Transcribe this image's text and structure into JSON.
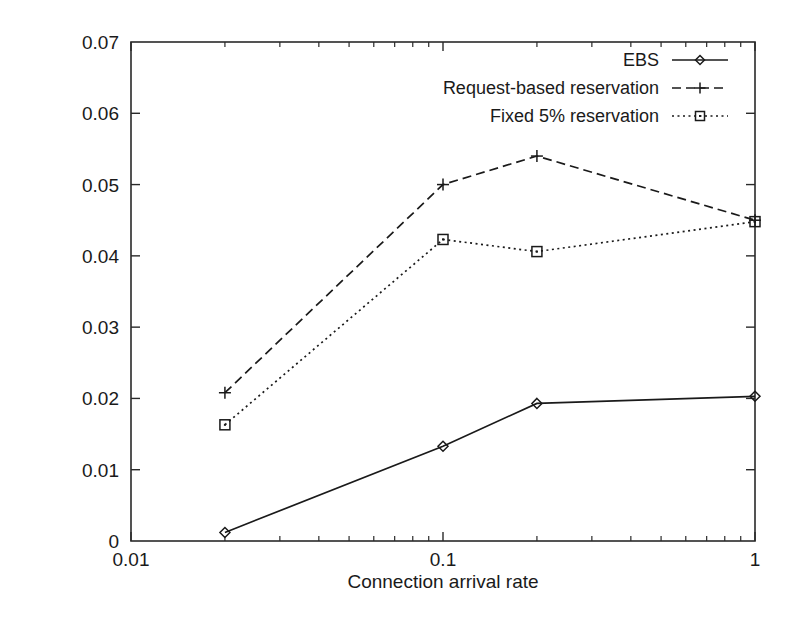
{
  "chart_data": {
    "type": "line",
    "title": "",
    "xlabel": "Connection arrival rate",
    "ylabel": "",
    "xscale": "log",
    "yscale": "linear",
    "xlim": [
      0.01,
      1
    ],
    "ylim": [
      0,
      0.07
    ],
    "grid": false,
    "legend_position": "top-right inside",
    "xticks": [
      "0.01",
      "0.1",
      "1"
    ],
    "xtick_values": [
      0.01,
      0.1,
      1
    ],
    "yticks": [
      "0",
      "0.01",
      "0.02",
      "0.03",
      "0.04",
      "0.05",
      "0.06",
      "0.07"
    ],
    "ytick_values": [
      0,
      0.01,
      0.02,
      0.03,
      0.04,
      0.05,
      0.06,
      0.07
    ],
    "x": [
      0.02,
      0.1,
      0.2,
      1
    ],
    "series": [
      {
        "name": "EBS",
        "values": [
          0.0012,
          0.0133,
          0.0193,
          0.0203
        ],
        "linestyle": "solid",
        "marker": "diamond"
      },
      {
        "name": "Request-based reservation",
        "values": [
          0.0208,
          0.05,
          0.054,
          0.045
        ],
        "linestyle": "dashed",
        "marker": "plus"
      },
      {
        "name": "Fixed 5% reservation",
        "values": [
          0.0163,
          0.0423,
          0.0406,
          0.0448
        ],
        "linestyle": "dotted",
        "marker": "square"
      }
    ]
  },
  "legend": {
    "entries": [
      {
        "label": "EBS"
      },
      {
        "label": "Request-based reservation"
      },
      {
        "label": "Fixed 5% reservation"
      }
    ]
  },
  "axes": {
    "x_title": "Connection arrival rate"
  },
  "colors": {
    "ink": "#1a1a1a",
    "background": "#ffffff"
  }
}
